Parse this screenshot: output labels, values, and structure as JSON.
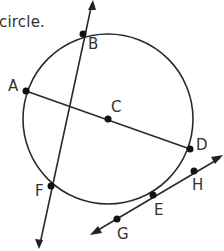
{
  "caption": "circle.",
  "colors": {
    "line": "#2a2a2a",
    "point": "#111111",
    "text": "#333333",
    "background": "#ffffff"
  },
  "diagram": {
    "circle": {
      "center_label": "C"
    },
    "points": [
      {
        "id": "A",
        "label": "A"
      },
      {
        "id": "B",
        "label": "B"
      },
      {
        "id": "C",
        "label": "C"
      },
      {
        "id": "D",
        "label": "D"
      },
      {
        "id": "E",
        "label": "E"
      },
      {
        "id": "F",
        "label": "F"
      },
      {
        "id": "G",
        "label": "G"
      },
      {
        "id": "H",
        "label": "H"
      }
    ],
    "segments": [
      {
        "name": "diameter",
        "from": "A",
        "to": "D",
        "through": "C"
      }
    ],
    "lines": [
      {
        "name": "secant",
        "through": [
          "B",
          "F"
        ],
        "arrows": "both"
      },
      {
        "name": "tangent",
        "through": [
          "G",
          "E",
          "H"
        ],
        "arrows": "both"
      }
    ]
  }
}
